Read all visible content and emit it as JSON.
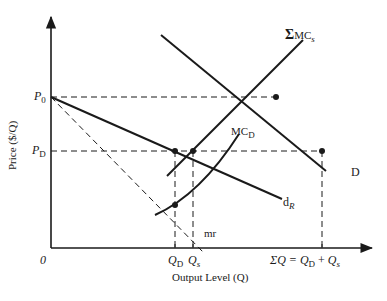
{
  "axes": {
    "y_label": "Price ($/Q)",
    "x_label": "Output Level (Q)",
    "origin_label": "0"
  },
  "price_labels": {
    "p0": {
      "main": "P",
      "sub": "0"
    },
    "pd": {
      "main": "P",
      "sub": "D"
    }
  },
  "quantity_labels": {
    "qd": {
      "main": "Q",
      "sub": "D"
    },
    "qs": {
      "main": "Q",
      "sub": "s"
    },
    "sum": {
      "prefix": "ΣQ = ",
      "a_main": "Q",
      "a_sub": "D",
      "plus": " + ",
      "b_main": "Q",
      "b_sub": "s"
    }
  },
  "curves": {
    "sum_mc": {
      "sigma": "Σ",
      "main": "MC",
      "sub": "s"
    },
    "mc_d": {
      "main": "MC",
      "sub": "D"
    },
    "demand": {
      "label": "D"
    },
    "residual_demand": {
      "main": "d",
      "sub": "R"
    },
    "marginal_revenue": {
      "label": "mr"
    }
  },
  "colors": {
    "ink": "#1a1a1a",
    "background": "#ffffff"
  }
}
